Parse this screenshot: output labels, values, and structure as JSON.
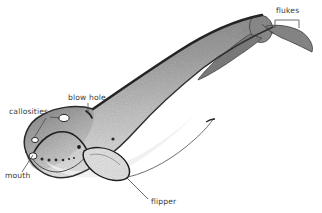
{
  "figure": {
    "kind": "scientific-illustration",
    "background_color": "#ffffff",
    "ink_color": "#2b2b2b",
    "label_color": "#3a3a3a",
    "body_dark_gray": "#8c8c8c",
    "body_mid_gray": "#a8a8a8",
    "body_light_gray": "#d2d2d2",
    "belly_light": "#e6e6e6"
  },
  "labels": {
    "flukes": "flukes",
    "blow_hole": "blow hole",
    "callosities": "callosities",
    "mouth": "mouth",
    "flipper": "flipper"
  },
  "anatomy_parts": [
    {
      "name": "flukes",
      "label": "flukes",
      "label_x": 276,
      "label_y": 13,
      "anchor_x": 288,
      "anchor_y": 27
    },
    {
      "name": "blow-hole",
      "label": "blow hole",
      "label_x": 68,
      "label_y": 100,
      "anchor_x": 88,
      "anchor_y": 113
    },
    {
      "name": "callosities",
      "label": "callosities",
      "label_x": 9,
      "label_y": 114,
      "anchor_x": 62,
      "anchor_y": 119
    },
    {
      "name": "mouth",
      "label": "mouth",
      "label_x": 5,
      "label_y": 177,
      "anchor_x": 38,
      "anchor_y": 156
    },
    {
      "name": "flipper",
      "label": "flipper",
      "label_x": 151,
      "label_y": 203,
      "anchor_x": 126,
      "anchor_y": 178
    }
  ]
}
